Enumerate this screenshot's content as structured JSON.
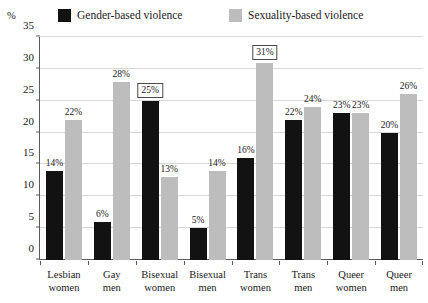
{
  "axis": {
    "unit_label": "%",
    "y_ticks": [
      "0",
      "5",
      "10",
      "15",
      "20",
      "25",
      "30",
      "35"
    ]
  },
  "legend": [
    {
      "label": "Gender-based violence",
      "color": "#121212",
      "name": "gender"
    },
    {
      "label": "Sexuality-based violence",
      "color": "#bdbdbd",
      "name": "sexual"
    }
  ],
  "chart_data": {
    "type": "bar",
    "title": "",
    "subtitle": "",
    "xlabel": "",
    "ylabel": "%",
    "ylim": [
      0,
      35
    ],
    "ytick_interval": 5,
    "grid": true,
    "legend_position": "top",
    "categories": [
      "Lesbian women",
      "Gay men",
      "Bisexual women",
      "Bisexual men",
      "Trans women",
      "Trans men",
      "Queer women",
      "Queer men"
    ],
    "category_lines": [
      [
        "Lesbian",
        "women"
      ],
      [
        "Gay",
        "men"
      ],
      [
        "Bisexual",
        "women"
      ],
      [
        "Bisexual",
        "men"
      ],
      [
        "Trans",
        "women"
      ],
      [
        "Trans",
        "men"
      ],
      [
        "Queer",
        "women"
      ],
      [
        "Queer",
        "men"
      ]
    ],
    "series": [
      {
        "name": "Gender-based violence",
        "color": "#121212",
        "values": [
          14,
          6,
          25,
          5,
          16,
          22,
          23,
          20
        ],
        "data_labels": [
          "14%",
          "6%",
          "25%",
          "5%",
          "16%",
          "22%",
          "23%",
          "20%"
        ],
        "highlighted": [
          false,
          false,
          true,
          false,
          false,
          false,
          false,
          false
        ]
      },
      {
        "name": "Sexuality-based violence",
        "color": "#bdbdbd",
        "values": [
          22,
          28,
          13,
          14,
          31,
          24,
          23,
          26
        ],
        "data_labels": [
          "22%",
          "28%",
          "13%",
          "14%",
          "31%",
          "24%",
          "23%",
          "26%"
        ],
        "highlighted": [
          false,
          false,
          false,
          false,
          true,
          false,
          false,
          false
        ]
      }
    ]
  }
}
